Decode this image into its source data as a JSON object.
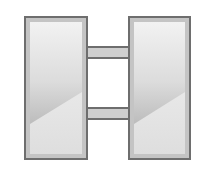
{
  "image": {
    "subject": "H-shaped icon",
    "colors": {
      "background": "#ffffff",
      "outline": "#6e6e6e",
      "inner_frame": "#c4c4c4",
      "fill_light": "#f0f0f0",
      "fill_mid": "#d6d6d6",
      "fill_dark": "#a9a9a9",
      "lower_fill": "#e6e6e6",
      "crossbar_fill": "#cfcfcf",
      "window_fill": "#ffffff"
    },
    "parts": [
      {
        "name": "left-pillar",
        "x": 24,
        "y": 16,
        "width": 64,
        "height": 144
      },
      {
        "name": "right-pillar",
        "x": 128,
        "y": 16,
        "width": 63,
        "height": 144
      },
      {
        "name": "top-crossbar",
        "x": 88,
        "y": 47,
        "width": 40,
        "height": 11
      },
      {
        "name": "bottom-crossbar",
        "x": 88,
        "y": 108,
        "width": 40,
        "height": 11
      }
    ]
  }
}
